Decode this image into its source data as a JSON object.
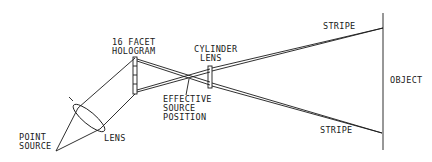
{
  "diagram": {
    "type": "optical-setup",
    "labels": {
      "hologram_line1": "16 FACET",
      "hologram_line2": "HOLOGRAM",
      "cylinder_line1": "CYLINDER",
      "cylinder_line2": "LENS",
      "stripe_top": "STRIPE",
      "stripe_bottom": "STRIPE",
      "object": "OBJECT",
      "effective_line1": "EFFECTIVE",
      "effective_line2": "SOURCE",
      "effective_line3": "POSITION",
      "point_line1": "POINT",
      "point_line2": "SOURCE",
      "lens": "LENS"
    },
    "colors": {
      "line": "#1a1a1a",
      "background": "#ffffff"
    }
  }
}
